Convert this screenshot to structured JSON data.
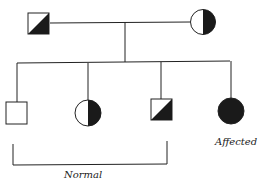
{
  "diagram": {
    "type": "pedigree",
    "colors": {
      "stroke": "#222222",
      "fill": "#1a1a1a",
      "background": "#ffffff"
    },
    "parents": [
      {
        "id": "father",
        "shape": "square",
        "shading": "diagonal-half",
        "status": "carrier"
      },
      {
        "id": "mother",
        "shape": "circle",
        "shading": "right-half",
        "status": "carrier"
      }
    ],
    "children": [
      {
        "id": "child1",
        "shape": "square",
        "shading": "none",
        "status": "normal"
      },
      {
        "id": "child2",
        "shape": "circle",
        "shading": "right-half",
        "status": "carrier"
      },
      {
        "id": "child3",
        "shape": "square",
        "shading": "diagonal-half",
        "status": "carrier"
      },
      {
        "id": "child4",
        "shape": "circle",
        "shading": "full",
        "status": "affected"
      }
    ],
    "labels": {
      "affected": "Affected",
      "normal": "Normal"
    }
  }
}
